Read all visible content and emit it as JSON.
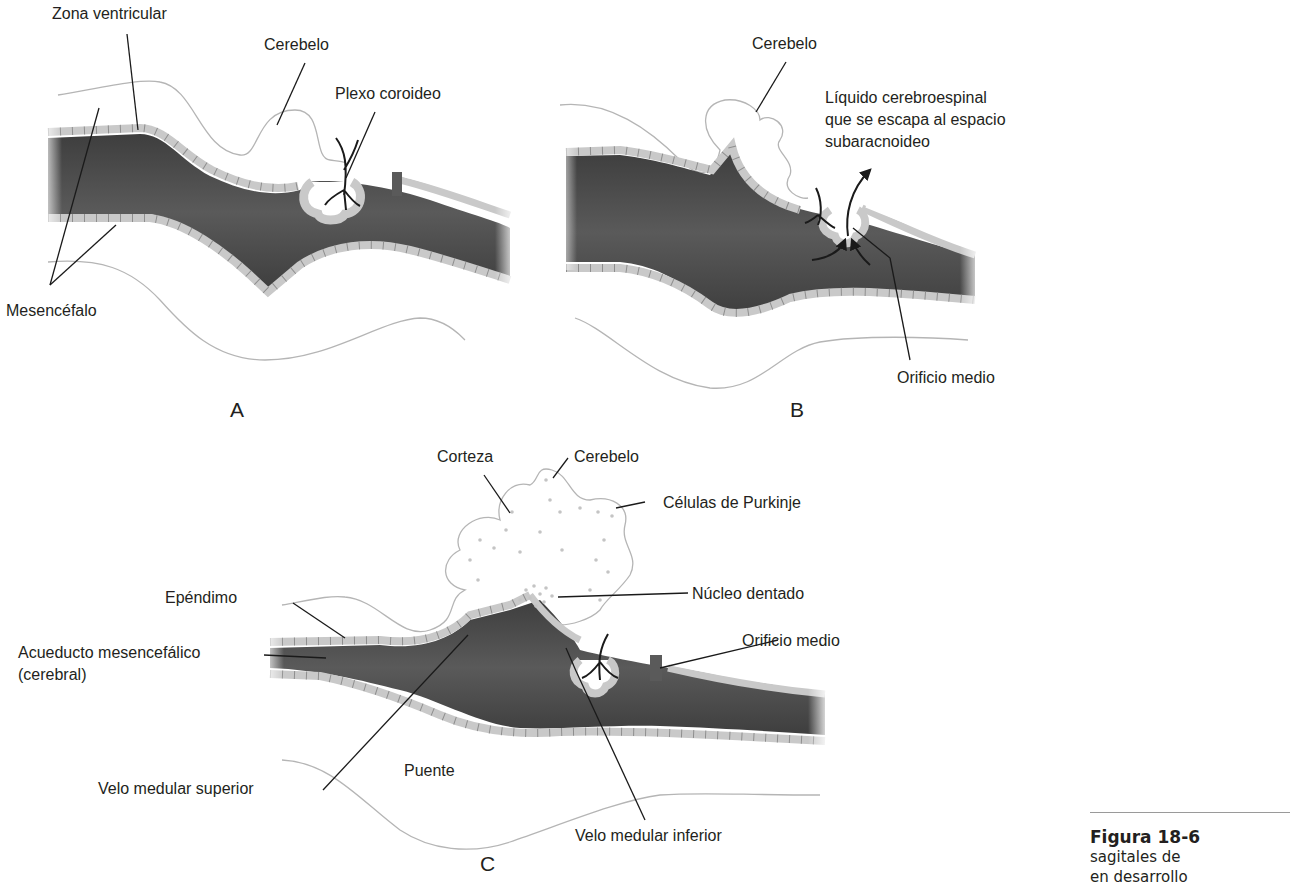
{
  "panels": {
    "A": {
      "letter": "A",
      "labels": {
        "zona_ventricular": "Zona ventricular",
        "cerebelo": "Cerebelo",
        "plexo_coroideo": "Plexo coroideo",
        "mesencefalo": "Mesencéfalo"
      }
    },
    "B": {
      "letter": "B",
      "labels": {
        "cerebelo": "Cerebelo",
        "liquido_line1": "Líquido cerebroespinal",
        "liquido_line2": "que se escapa al espacio",
        "liquido_line3": "subaracnoideo",
        "orificio_medio": "Orificio medio"
      }
    },
    "C": {
      "letter": "C",
      "labels": {
        "corteza": "Corteza",
        "cerebelo": "Cerebelo",
        "celulas_purkinje": "Células de Purkinje",
        "ependimo": "Epéndimo",
        "nucleo_dentado": "Núcleo dentado",
        "orificio_medio": "Orificio medio",
        "acueducto_line1": "Acueducto mesencefálico",
        "acueducto_line2": "(cerebral)",
        "velo_superior": "Velo medular superior",
        "puente": "Puente",
        "velo_inferior": "Velo medular inferior"
      }
    }
  },
  "caption": {
    "figure": "Figura 18-6",
    "line2": "sagitales de",
    "line3": "en desarrollo"
  },
  "colors": {
    "ventricle_dark": "#4a4a4a",
    "ependyma": "#c9c9c9",
    "ependyma_stroke": "#9a9a9a",
    "outline": "#b5b5b5",
    "leader": "#1a1a1a"
  }
}
